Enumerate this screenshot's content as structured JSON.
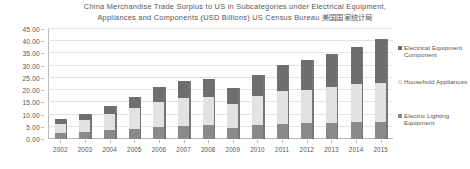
{
  "chart_data": {
    "type": "bar",
    "subtype": "stacked-column",
    "title": "China Merchandise Trade Surplus to US in Subcategories under Electrical Equipment, Appliances and Components (USD Billions) US Census Bureau 美国国家统计局",
    "title_lines": [
      "China Merchandise Trade Surplus to US in Subcategories under Electrical Equipment,",
      "Appliances and Components (USD Billions) US Census Bureau 美国国家统计局"
    ],
    "xlabel": "",
    "ylabel": "",
    "ylim": [
      0,
      45
    ],
    "ytick_step": 5,
    "ytick_labels": [
      "0.00",
      "5.00",
      "10.00",
      "15.00",
      "20.00",
      "25.00",
      "30.00",
      "35.00",
      "40.00",
      "45.00"
    ],
    "ytick_values": [
      0,
      5,
      10,
      15,
      20,
      25,
      30,
      35,
      40,
      45
    ],
    "grid": true,
    "legend_position": "right",
    "categories": [
      "2002",
      "2003",
      "2004",
      "2005",
      "2006",
      "2007",
      "2008",
      "2009",
      "2010",
      "2011",
      "2012",
      "2013",
      "2014",
      "2015"
    ],
    "series": [
      {
        "name": "Electric Lighting Equipment",
        "color": "#8a8a8a",
        "stack_order": 0,
        "values": [
          2.4,
          2.9,
          3.6,
          4.2,
          4.9,
          5.4,
          5.6,
          4.6,
          5.6,
          6.3,
          6.4,
          6.6,
          6.9,
          7.0
        ]
      },
      {
        "name": "Household Appliances",
        "color": "#e2e2e2",
        "stack_order": 1,
        "values": [
          3.8,
          4.8,
          6.6,
          8.4,
          10.2,
          11.2,
          11.4,
          9.6,
          12.2,
          13.4,
          13.8,
          14.6,
          15.6,
          16.0
        ]
      },
      {
        "name": "Electrical Equipment Component",
        "color": "#6e6e6e",
        "stack_order": 2,
        "values": [
          1.9,
          2.4,
          3.3,
          4.4,
          6.0,
          7.0,
          7.6,
          6.5,
          8.5,
          10.6,
          12.0,
          13.4,
          15.0,
          17.8
        ]
      }
    ],
    "totals": [
      8.1,
      10.1,
      13.5,
      17.0,
      21.1,
      23.6,
      24.6,
      20.7,
      26.3,
      30.3,
      32.2,
      34.6,
      37.5,
      40.8
    ]
  },
  "legend": {
    "items": [
      {
        "label": "Electrical Equipment Component",
        "color": "#6e6e6e"
      },
      {
        "label": "Household Appliances",
        "color": "#e2e2e2"
      },
      {
        "label": "Electric Lighting Equipment",
        "color": "#8a8a8a"
      }
    ]
  },
  "style": {
    "background": "#ffffff",
    "grid_color": "#e2e2e2",
    "axis_color": "#b9b9b9",
    "text_color": "#555555"
  }
}
